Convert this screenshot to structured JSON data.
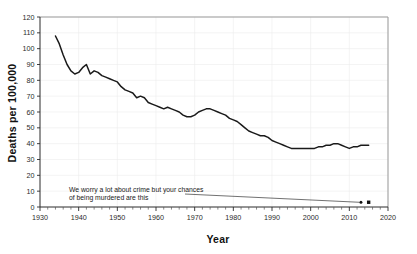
{
  "chart_data": {
    "type": "line",
    "title": "",
    "xlabel": "Year",
    "ylabel": "Deaths per 100,000",
    "xlim": [
      1930,
      2020
    ],
    "ylim": [
      0,
      120
    ],
    "grid": true,
    "legend_position": "none",
    "x_ticks": [
      1930,
      1940,
      1950,
      1960,
      1970,
      1980,
      1990,
      2000,
      2010,
      2020
    ],
    "x_tick_labels": [
      "1930",
      "1940",
      "1950",
      "1960",
      "1970",
      "1980",
      "1990",
      "2000",
      "2010",
      "2020"
    ],
    "x_minor_tick_step": 2,
    "y_ticks": [
      0,
      10,
      20,
      30,
      40,
      50,
      60,
      70,
      80,
      90,
      100,
      110,
      120
    ],
    "y_tick_labels": [
      "0",
      "10",
      "20",
      "30",
      "40",
      "50",
      "60",
      "70",
      "80",
      "90",
      "100",
      "110",
      "120"
    ],
    "series": [
      {
        "name": "Deaths per 100,000",
        "x": [
          1934,
          1935,
          1936,
          1937,
          1938,
          1939,
          1940,
          1941,
          1942,
          1943,
          1944,
          1945,
          1946,
          1947,
          1948,
          1949,
          1950,
          1951,
          1952,
          1953,
          1954,
          1955,
          1956,
          1957,
          1958,
          1959,
          1960,
          1961,
          1962,
          1963,
          1964,
          1965,
          1966,
          1967,
          1968,
          1969,
          1970,
          1971,
          1972,
          1973,
          1974,
          1975,
          1976,
          1977,
          1978,
          1979,
          1980,
          1981,
          1982,
          1983,
          1984,
          1985,
          1986,
          1987,
          1988,
          1989,
          1990,
          1991,
          1992,
          1993,
          1994,
          1995,
          1996,
          1997,
          1998,
          1999,
          2000,
          2001,
          2002,
          2003,
          2004,
          2005,
          2006,
          2007,
          2008,
          2009,
          2010,
          2011,
          2012,
          2013,
          2014,
          2015
        ],
        "y": [
          108,
          103,
          96,
          90,
          86,
          84,
          85,
          88,
          90,
          84,
          86,
          85,
          83,
          82,
          81,
          80,
          79,
          76,
          74,
          73,
          72,
          69,
          70,
          69,
          66,
          65,
          64,
          63,
          62,
          63,
          62,
          61,
          60,
          58,
          57,
          57,
          58,
          60,
          61,
          62,
          62,
          61,
          60,
          59,
          58,
          56,
          55,
          54,
          52,
          50,
          48,
          47,
          46,
          45,
          45,
          44,
          42,
          41,
          40,
          39,
          38,
          37,
          37,
          37,
          37,
          37,
          37,
          37,
          38,
          38,
          39,
          39,
          40,
          40,
          39,
          38,
          37,
          38,
          38,
          39,
          39,
          39
        ]
      }
    ],
    "annotations": [
      {
        "text_line_1": "We worry a lot about crime but your chances",
        "text_line_2": "of being murdered are this",
        "leader_from": [
          1967.5,
          8.2
        ],
        "leader_to": [
          2012.5,
          3.0
        ],
        "points": [
          {
            "x": 2013,
            "y": 3.0
          },
          {
            "x": 2015,
            "y": 3.0
          }
        ]
      }
    ]
  },
  "colors": {
    "series_line": "#1a1a1a",
    "frame": "#9a9a9a",
    "axis": "#2a2a2a",
    "grid": "#ececec",
    "background": "#ffffff",
    "text": "#111111"
  }
}
